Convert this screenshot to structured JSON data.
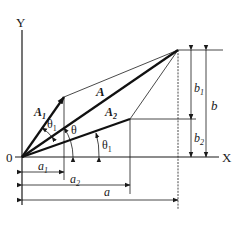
{
  "diagram": {
    "axes": {
      "x_label": "X",
      "y_label": "Y",
      "origin_label": "0"
    },
    "vectors": [
      {
        "id": "A1",
        "label": "A",
        "sub": "1",
        "from": [
          22,
          157
        ],
        "to": [
          64,
          97
        ]
      },
      {
        "id": "A2",
        "label": "A",
        "sub": "2",
        "from": [
          22,
          157
        ],
        "to": [
          130,
          119
        ]
      },
      {
        "id": "A",
        "label": "A",
        "sub": "",
        "from": [
          22,
          157
        ],
        "to": [
          178,
          50
        ]
      }
    ],
    "angles": [
      {
        "label": "θ",
        "sub": "1",
        "desc": "angle of A2 from X axis"
      },
      {
        "label": "θ",
        "sub": "",
        "desc": "angle of A from X axis"
      },
      {
        "label": "θ",
        "sub": "1",
        "desc": "angle between A1 and A (displayed as θ1 near A1)"
      }
    ],
    "dimensions": {
      "horizontal": [
        {
          "label": "a",
          "sub": "1"
        },
        {
          "label": "a",
          "sub": "2"
        },
        {
          "label": "a",
          "sub": ""
        }
      ],
      "vertical": [
        {
          "label": "b",
          "sub": "1"
        },
        {
          "label": "b",
          "sub": "2"
        },
        {
          "label": "b",
          "sub": ""
        }
      ]
    },
    "colors": {
      "ink": "#1a1a1a",
      "background": "#ffffff"
    }
  },
  "labels": {
    "y": "Y",
    "x": "X",
    "o": "0",
    "A1_main": "A",
    "A1_sub": "1",
    "A_main": "A",
    "A2_main": "A",
    "A2_sub": "2",
    "theta1_main": "θ",
    "theta1_sub": "1",
    "theta_main": "θ",
    "thetaA1_main": "θ",
    "thetaA1_sub": "1",
    "a1_main": "a",
    "a1_sub": "1",
    "a2_main": "a",
    "a2_sub": "2",
    "a_main": "a",
    "b1_main": "b",
    "b1_sub": "1",
    "b2_main": "b",
    "b2_sub": "2",
    "b_main": "b"
  }
}
